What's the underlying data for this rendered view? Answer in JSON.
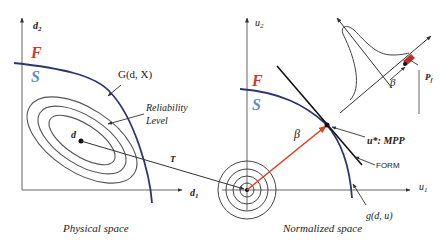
{
  "colors": {
    "failure": "#d0392b",
    "safe": "#5b8fc9",
    "limit_state": "#2c3570",
    "beta_arrow": "#e04020",
    "ink": "#333333"
  },
  "physical": {
    "axis_x": "d",
    "axis_x_sub": "1",
    "axis_y": "d",
    "axis_y_sub": "2",
    "region_fail": "F",
    "region_safe": "S",
    "limit_state_label": "G(d, X)",
    "reliability_label_1": "Reliability",
    "reliability_label_2": "Level",
    "point_label": "d",
    "transform_label": "T",
    "caption": "Physical space"
  },
  "normalized": {
    "axis_x": "u",
    "axis_x_sub": "1",
    "axis_y": "u",
    "axis_y_sub": "2",
    "region_fail": "F",
    "region_safe": "S",
    "beta_label": "β",
    "mpp_label": "u*: MPP",
    "form_label": "FORM",
    "limit_state_label": "g(d, u)",
    "caption": "Normalized space"
  },
  "inset": {
    "beta_label": "β",
    "pf_label": "P",
    "pf_sub": "f"
  }
}
